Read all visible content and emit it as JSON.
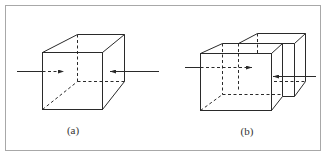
{
  "figure": {
    "colors": {
      "line": "#2a2a2a",
      "frame": "#a8a8a8",
      "background": "#ffffff"
    },
    "panels": [
      {
        "id": "a",
        "label": "(a)",
        "description": "Single cube with two opposing arrows pointing into it from left and right",
        "arrows": [
          {
            "direction": "right",
            "from": "left"
          },
          {
            "direction": "left",
            "from": "right"
          }
        ]
      },
      {
        "id": "b",
        "label": "(b)",
        "description": "Two overlapping (offset) cubes with arrows entering from left and right",
        "arrows": [
          {
            "direction": "right",
            "from": "left"
          },
          {
            "direction": "left",
            "from": "right"
          }
        ]
      }
    ]
  }
}
